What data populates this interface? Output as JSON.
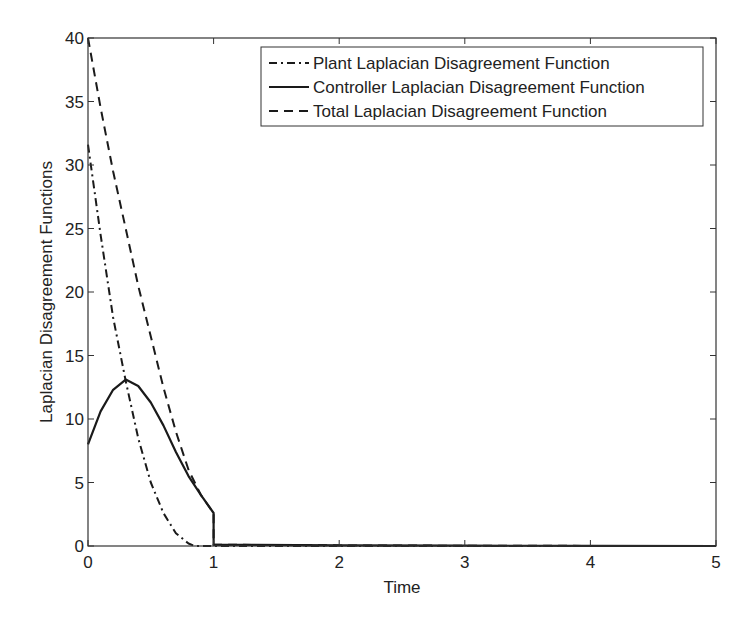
{
  "chart_data": {
    "type": "line",
    "title": "",
    "xlabel": "Time",
    "ylabel": "Laplacian Disagreement Functions",
    "xlim": [
      0,
      5
    ],
    "ylim": [
      0,
      40
    ],
    "xticks": [
      0,
      1,
      2,
      3,
      4,
      5
    ],
    "yticks": [
      0,
      5,
      10,
      15,
      20,
      25,
      30,
      35,
      40
    ],
    "grid": false,
    "legend_position": "upper right",
    "series": [
      {
        "name": "Plant Laplacian Disagreement Function",
        "style": "dash-dot",
        "x": [
          0,
          0.1,
          0.2,
          0.3,
          0.4,
          0.5,
          0.6,
          0.7,
          0.8,
          0.85,
          1.0,
          2,
          3,
          4,
          5
        ],
        "y": [
          31.6,
          24.5,
          18,
          13,
          8.5,
          5,
          2.6,
          1,
          0.2,
          0,
          0,
          0,
          0,
          0,
          0
        ]
      },
      {
        "name": "Controller Laplacian Disagreement Function",
        "style": "solid",
        "x": [
          0,
          0.1,
          0.2,
          0.3,
          0.4,
          0.5,
          0.6,
          0.7,
          0.8,
          0.9,
          1.0,
          1.0,
          2,
          3,
          4,
          5
        ],
        "y": [
          8,
          10.6,
          12.3,
          13.1,
          12.6,
          11.3,
          9.5,
          7.4,
          5.5,
          4,
          2.6,
          0.1,
          0.05,
          0.02,
          0.01,
          0
        ]
      },
      {
        "name": "Total Laplacian Disagreement Function",
        "style": "dashed",
        "x": [
          0,
          0.1,
          0.2,
          0.3,
          0.4,
          0.5,
          0.6,
          0.7,
          0.8,
          0.9,
          1.0,
          1.0,
          2,
          3,
          4,
          5
        ],
        "y": [
          40,
          34.5,
          29.5,
          25,
          20.5,
          16.5,
          12.5,
          9,
          6,
          4,
          2.6,
          0.1,
          0.05,
          0.02,
          0.01,
          0
        ]
      }
    ]
  },
  "legend": {
    "items": [
      "Plant Laplacian Disagreement Function",
      "Controller Laplacian Disagreement Function",
      "Total Laplacian Disagreement Function"
    ]
  },
  "colors": {
    "line": "#1a1a1a",
    "axis": "#333333",
    "background": "#ffffff"
  }
}
